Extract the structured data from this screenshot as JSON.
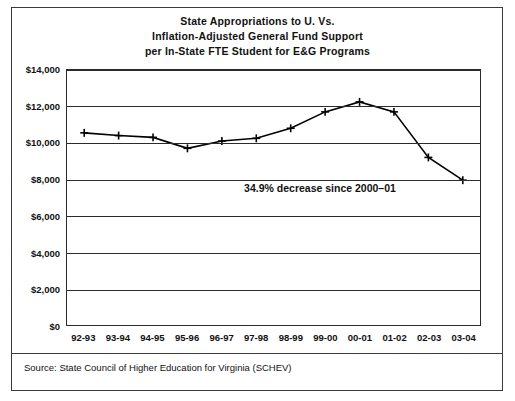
{
  "chart_data": {
    "type": "line",
    "title": "State Appropriations to U. Vs.\nInflation-Adjusted General Fund Support\nper In-State FTE Student for E&G Programs",
    "title_lines": [
      "State Appropriations to U. Vs.",
      "Inflation-Adjusted General Fund Support",
      "per In-State FTE Student for E&G Programs"
    ],
    "xlabel": "",
    "ylabel": "",
    "categories": [
      "92-93",
      "93-94",
      "94-95",
      "95-96",
      "96-97",
      "97-98",
      "98-99",
      "99-00",
      "00-01",
      "01-02",
      "02-03",
      "03-04"
    ],
    "values": [
      10550,
      10400,
      10300,
      9700,
      10100,
      10250,
      10800,
      11700,
      12250,
      11700,
      9200,
      7950
    ],
    "ylim": [
      0,
      14000
    ],
    "ytick_labels": [
      "$14,000",
      "$12,000",
      "$10,000",
      "$8,000",
      "$6,000",
      "$4,000",
      "$2,000",
      "$0"
    ],
    "ytick_values": [
      14000,
      12000,
      10000,
      8000,
      6000,
      4000,
      2000,
      0
    ],
    "grid": "horizontal",
    "legend": "none",
    "marker": "plus",
    "line_color": "#000000",
    "annotations": [
      {
        "name": "decrease-annotation",
        "text": "34.9% decrease since 2000–01"
      }
    ],
    "source_note": "Source: State Council of Higher Education for Virginia (SCHEV)"
  }
}
